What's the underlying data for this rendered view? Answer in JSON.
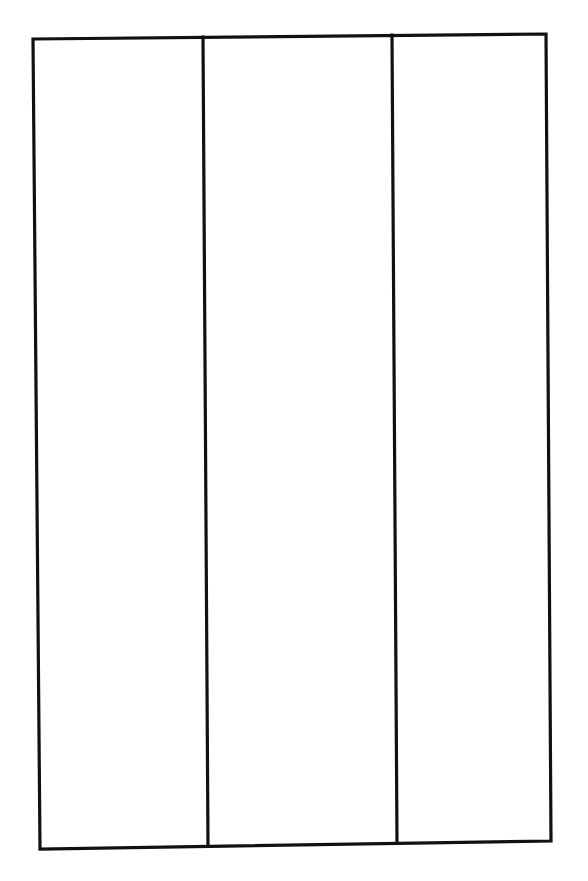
{
  "diagram": {
    "type": "three-panel-outline",
    "panel_count": 3,
    "stroke_color": "#111111",
    "background_color": "#ffffff",
    "outer_frame": {
      "top_left": [
        33,
        39
      ],
      "top_right": [
        546,
        34
      ],
      "bottom_right": [
        551,
        841
      ],
      "bottom_left": [
        40,
        849
      ]
    },
    "dividers": [
      {
        "top": [
          203,
          37
        ],
        "bottom": [
          208,
          846
        ]
      },
      {
        "top": [
          392,
          35
        ],
        "bottom": [
          397,
          843
        ]
      }
    ],
    "panels": [
      {
        "index": 1,
        "label": ""
      },
      {
        "index": 2,
        "label": ""
      },
      {
        "index": 3,
        "label": ""
      }
    ]
  }
}
